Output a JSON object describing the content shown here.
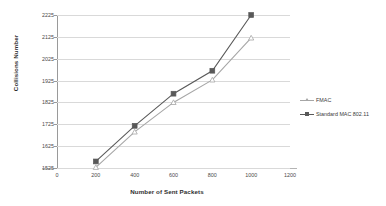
{
  "chart_data": {
    "type": "line",
    "title": "",
    "xlabel": "Number of Sent Packets",
    "ylabel": "Collisions Number",
    "x": [
      200,
      400,
      600,
      800,
      1000
    ],
    "xlim": [
      0,
      1200
    ],
    "ylim": [
      1525,
      2225
    ],
    "xticks": [
      "0",
      "200",
      "400",
      "600",
      "800",
      "1000",
      "1200"
    ],
    "yticks": [
      "1525",
      "1625",
      "1725",
      "1825",
      "1925",
      "2025",
      "2125",
      "2225"
    ],
    "grid": "horizontal",
    "legend_position": "right",
    "series": [
      {
        "name": "FMAC",
        "values": [
          1528,
          1690,
          1825,
          1928,
          2120
        ],
        "color": "#a6a6a6",
        "marker": "triangle"
      },
      {
        "name": "Standard MAC 802.11",
        "values": [
          1555,
          1718,
          1865,
          1970,
          2225
        ],
        "color": "#595959",
        "marker": "square"
      }
    ]
  },
  "axes": {
    "y_title": "Collisions Number",
    "x_title": "Number of Sent Packets"
  },
  "legend": {
    "items": [
      {
        "label": "FMAC"
      },
      {
        "label": "Standard MAC 802.11"
      }
    ]
  },
  "colors": {
    "series_light": "#a6a6a6",
    "series_dark": "#595959",
    "gridline": "#d9d9d9",
    "axis": "#9a9a9a",
    "text": "#3b3b3b",
    "background": "#ffffff"
  }
}
